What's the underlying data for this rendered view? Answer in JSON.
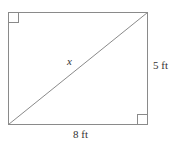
{
  "diagram": {
    "type": "rectangle-with-diagonal",
    "labels": {
      "diagonal": "x",
      "height": "5 ft",
      "width": "8 ft"
    },
    "right_angle_markers": [
      "top-left",
      "bottom-right"
    ],
    "colors": {
      "stroke": "#8a8a8a",
      "text": "#333333",
      "background": "#ffffff"
    }
  }
}
